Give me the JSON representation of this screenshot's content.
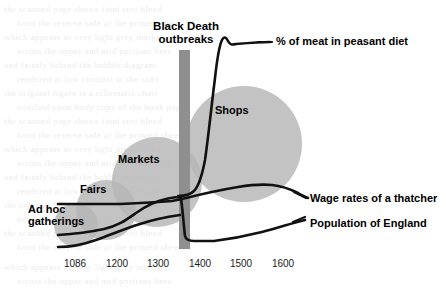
{
  "figure": {
    "title": "",
    "background_color": "#ffffff",
    "bubble_color": "#b6b6b6",
    "bar_color": "#8f8f8f",
    "line_color": "#111111"
  },
  "event_marker": {
    "label_line1": "Black Death",
    "label_line2": "outbreaks",
    "x_year": 1348
  },
  "bubbles": [
    {
      "label": "Ad hoc gatherings",
      "label_line1": "Ad hoc",
      "label_line2": "gatherings"
    },
    {
      "label": "Fairs"
    },
    {
      "label": "Markets"
    },
    {
      "label": "Shops"
    }
  ],
  "series_labels": [
    {
      "name": "meat",
      "label": "% of meat in peasant diet"
    },
    {
      "name": "wages",
      "label": "Wage rates of a thatcher"
    },
    {
      "name": "population",
      "label": "Population of England"
    }
  ],
  "axis": {
    "ticks": [
      "1086",
      "1200",
      "1300",
      "1400",
      "1500",
      "1600"
    ]
  },
  "chart_data": {
    "type": "line",
    "title": "",
    "xlabel": "",
    "ylabel": "",
    "grid": false,
    "legend_position": "right-inline-labels",
    "xlim": [
      1060,
      1650
    ],
    "x_tick_values": [
      1086,
      1200,
      1300,
      1400,
      1500,
      1600
    ],
    "x_tick_labels": [
      "1086",
      "1200",
      "1300",
      "1400",
      "1500",
      "1600"
    ],
    "annotations": [
      {
        "text": "Black Death outbreaks",
        "type": "vertical-band",
        "x": 1348
      }
    ],
    "bubbles": [
      {
        "label": "Ad hoc gatherings",
        "cx_year": 1095,
        "cy_rel": 0.14,
        "r_rel": 0.095
      },
      {
        "label": "Fairs",
        "cx_year": 1135,
        "cy_rel": 0.21,
        "r_rel": 0.13
      },
      {
        "label": "Markets",
        "cx_year": 1215,
        "cy_rel": 0.33,
        "r_rel": 0.195
      },
      {
        "label": "Shops",
        "cx_year": 1430,
        "cy_rel": 0.5,
        "r_rel": 0.26
      }
    ],
    "series": [
      {
        "name": "% of meat in peasant diet",
        "x": [
          1348,
          1352,
          1360,
          1370,
          1382,
          1395,
          1410,
          1422,
          1428,
          1440,
          1470,
          1500,
          1520
        ],
        "y": [
          0.24,
          0.24,
          0.26,
          0.3,
          0.38,
          0.56,
          0.76,
          0.91,
          0.96,
          0.92,
          0.92,
          0.92,
          0.92
        ]
      },
      {
        "name": "Wage rates of a thatcher",
        "x": [
          1086,
          1200,
          1280,
          1320,
          1344,
          1348,
          1352,
          1380,
          1420,
          1470,
          1510,
          1540,
          1575
        ],
        "y": [
          0.205,
          0.205,
          0.205,
          0.207,
          0.21,
          0.212,
          0.215,
          0.225,
          0.25,
          0.285,
          0.3,
          0.285,
          0.27
        ]
      },
      {
        "name": "Population of England",
        "x": [
          1086,
          1140,
          1200,
          1240,
          1280,
          1320,
          1340,
          1346,
          1352,
          1362,
          1400,
          1440,
          1490,
          1540,
          1575
        ],
        "y": [
          0.105,
          0.11,
          0.122,
          0.15,
          0.185,
          0.205,
          0.212,
          0.213,
          0.145,
          0.118,
          0.113,
          0.128,
          0.15,
          0.172,
          0.2
        ]
      },
      {
        "name": "Ad hoc baseline",
        "x": [
          1086,
          1140,
          1200,
          1260,
          1310,
          1348
        ],
        "y": [
          0.07,
          0.075,
          0.085,
          0.105,
          0.122,
          0.13
        ]
      }
    ]
  },
  "bleed_text": {
    "enabled": true,
    "lines": [
      "the scanned page shows faint text bleed",
      "from the reverse side of the printed sheet",
      "which appears as very light grey marks",
      "across the upper and mid portions here",
      "and faintly behind the bubble diagram",
      "rendered at low contrast in the scan",
      "the original figure is a schematic chart",
      "overlaid upon body copy of the book page"
    ]
  }
}
